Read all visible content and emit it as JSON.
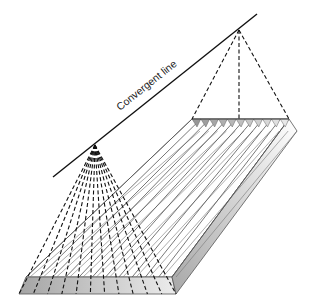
{
  "diagram": {
    "label": "Convergent line",
    "colors": {
      "line": "#111111",
      "strip": "#555555",
      "face_dark": "#a8a8a8",
      "face_light": "#e6e6e6",
      "background": "#ffffff"
    },
    "convergent_line": {
      "x1": 53,
      "y1": 177,
      "x2": 257,
      "y2": 14
    },
    "near_apex": {
      "x": 95,
      "y": 145
    },
    "far_apex": {
      "x": 239,
      "y": 30
    },
    "slab": {
      "near_edge": {
        "x1": 26,
        "x2": 172,
        "y": 277
      },
      "near_bottom": {
        "x1": 19,
        "x2": 176,
        "y": 294
      },
      "far_edge": {
        "x1": 192,
        "x2": 289,
        "y": 119
      },
      "far_right_bottom": {
        "x": 297,
        "y": 131
      },
      "strip_count": 11
    }
  }
}
